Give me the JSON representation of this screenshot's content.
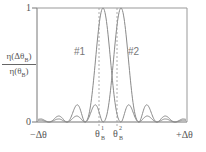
{
  "chart_data": {
    "type": "line",
    "title": "",
    "xlabel": "Δθ",
    "ylabel": "η(Δθ_B) / η(θ_B)",
    "x_ticks": [
      "-Δθ",
      "θ_B^1",
      "θ_B^2",
      "+Δθ"
    ],
    "y_ticks": [
      "0",
      "1"
    ],
    "ylim": [
      0,
      1
    ],
    "xlim": [
      -1,
      1
    ],
    "grid": false,
    "legend": "inline labels",
    "series": [
      {
        "name": "#1",
        "center": -0.12,
        "shape": "sinc^2",
        "peak": 1.0,
        "first_zero_halfwidth": 0.24
      },
      {
        "name": "#2",
        "center": 0.12,
        "shape": "sinc^2",
        "peak": 1.0,
        "first_zero_halfwidth": 0.24
      }
    ],
    "annotations": [
      "dashed vertical line at θ_B^1",
      "dashed vertical line at θ_B^2"
    ],
    "colors": {
      "curve": "#8a8a8a",
      "axis": "#777777",
      "dashed": "#999999"
    }
  },
  "labels": {
    "y_one": "1",
    "y_zero": "0",
    "ylabel_num": "η(Δθ",
    "ylabel_num_sub": "B",
    "ylabel_num_end": ")",
    "ylabel_den": "η(θ",
    "ylabel_den_sub": "B",
    "ylabel_den_end": ")",
    "series1": "#1",
    "series2": "#2",
    "x_left": "−Δθ",
    "x_right": "+Δθ",
    "theta": "θ",
    "theta1_sup": "1",
    "theta2_sup": "2",
    "theta_sub": "B"
  }
}
